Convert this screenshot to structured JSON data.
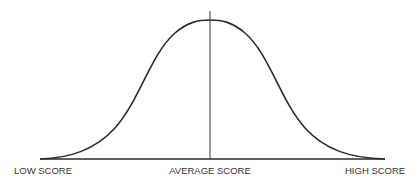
{
  "diagram": {
    "type": "bell-curve",
    "labels": {
      "left": "LOW SCORE",
      "center": "AVERAGE SCORE",
      "right": "HIGH SCORE"
    },
    "colors": {
      "curve": "#2b2b2b",
      "axis": "#2b2b2b",
      "mean_line": "#333333",
      "text": "#333333",
      "background": "#ffffff"
    }
  }
}
